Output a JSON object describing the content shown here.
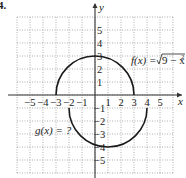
{
  "problem_label": "4.",
  "graph": {
    "x_axis_label": "x",
    "y_axis_label": "y",
    "x_range": [
      -6,
      6
    ],
    "y_range": [
      -6,
      6
    ],
    "x_tick_labels": [
      "-5",
      "-4",
      "-3",
      "-2",
      "-1",
      "1",
      "2",
      "3",
      "4",
      "5"
    ],
    "x_tick_values": [
      -5,
      -4,
      -3,
      -2,
      -1,
      1,
      2,
      3,
      4,
      5
    ],
    "y_tick_labels": [
      "5",
      "4",
      "3",
      "2",
      "1",
      "-1",
      "-2",
      "-3",
      "-4",
      "-5"
    ],
    "y_tick_values": [
      5,
      4,
      3,
      2,
      1,
      -1,
      -2,
      -3,
      -4,
      -5
    ],
    "grid": "dotted",
    "curves": [
      {
        "name": "f",
        "description": "upper semicircle",
        "center": [
          0,
          0
        ],
        "radius": 3,
        "half": "upper",
        "label_text": "f(x) = √(9 − x²)"
      },
      {
        "name": "g",
        "description": "lower semicircle shifted",
        "center": [
          1,
          -1
        ],
        "radius": 3,
        "half": "lower",
        "label_text": "g(x) = ?"
      }
    ],
    "labels": {
      "f_prefix": "f(x) = ",
      "f_radicand": "9 − x",
      "f_exponent": "2",
      "g_label": "g(x) = ?"
    },
    "colors": {
      "curve": "#1a1a1a",
      "grid": "#9a9a9a",
      "axis": "#333333"
    }
  }
}
